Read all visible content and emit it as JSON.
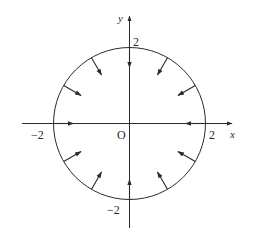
{
  "diagram": {
    "title": "",
    "colors": {
      "stroke": "#2a2a2a",
      "background": "#ffffff"
    },
    "geometry": {
      "center_px": [
        129.5,
        123.5
      ],
      "radius_px": 76,
      "x_axis_px": [
        22,
        232
      ],
      "y_axis_px": [
        228,
        16
      ],
      "arrow_angles_deg": [
        0,
        30,
        60,
        90,
        120,
        150,
        180,
        210,
        240,
        270,
        300,
        330
      ],
      "arrow_start_r_px": 76,
      "arrow_end_r_px": 56,
      "arrow_direction": "inward"
    },
    "labels": {
      "x_axis": "x",
      "y_axis": "y",
      "origin": "O",
      "x_pos_tick": "2",
      "x_neg_tick": "−2",
      "y_pos_tick": "2",
      "y_neg_tick": "−2"
    }
  }
}
